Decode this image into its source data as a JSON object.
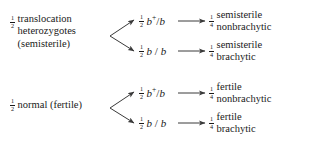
{
  "diagram": {
    "type": "genetics-cross-branch-diagram",
    "background_color": "#ffffff",
    "text_color": "#1a1a1a",
    "arrow_color": "#3a3a3a",
    "parents": [
      {
        "id": "translocation",
        "fraction_numerator": "1",
        "fraction_denominator": "2",
        "lines": [
          "translocation",
          "heterozygotes",
          "(semisterile)"
        ]
      },
      {
        "id": "normal",
        "fraction_numerator": "1",
        "fraction_denominator": "2",
        "lines": [
          "normal (fertile)"
        ]
      }
    ],
    "gametes": [
      {
        "id": "het-bplusb",
        "fraction_numerator": "1",
        "fraction_denominator": "2",
        "allele_left": "b",
        "allele_left_superscript": "+",
        "separator": "/",
        "allele_right": "b"
      },
      {
        "id": "het-bb",
        "fraction_numerator": "1",
        "fraction_denominator": "2",
        "allele_left": "b",
        "allele_left_superscript": "",
        "separator": " / ",
        "allele_right": "b"
      },
      {
        "id": "nor-bplusb",
        "fraction_numerator": "1",
        "fraction_denominator": "2",
        "allele_left": "b",
        "allele_left_superscript": "+",
        "separator": "/",
        "allele_right": "b"
      },
      {
        "id": "nor-bb",
        "fraction_numerator": "1",
        "fraction_denominator": "2",
        "allele_left": "b",
        "allele_left_superscript": "",
        "separator": " / ",
        "allele_right": "b"
      }
    ],
    "progeny": [
      {
        "id": "semi-nonbr",
        "fraction_numerator": "1",
        "fraction_denominator": "4",
        "lines": [
          "semisterile",
          "nonbrachytic"
        ]
      },
      {
        "id": "semi-brachy",
        "fraction_numerator": "1",
        "fraction_denominator": "4",
        "lines": [
          "semisterile",
          "brachytic"
        ]
      },
      {
        "id": "fert-nonbr",
        "fraction_numerator": "1",
        "fraction_denominator": "4",
        "lines": [
          "fertile",
          "nonbrachytic"
        ]
      },
      {
        "id": "fert-brachy",
        "fraction_numerator": "1",
        "fraction_denominator": "4",
        "lines": [
          "fertile",
          "brachytic"
        ]
      }
    ]
  }
}
